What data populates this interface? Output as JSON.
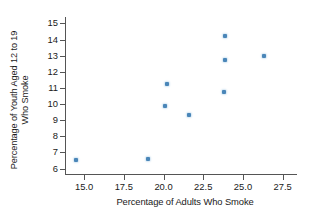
{
  "chart_data": {
    "type": "scatter",
    "title": "",
    "xlabel": "Percentage of Adults Who Smoke",
    "ylabel": "Percentage of Youth Aged 12 to 19 Who Smoke",
    "ylabel_line1": "Percentage of Youth Aged 12 to 19",
    "ylabel_line2": "Who Smoke",
    "xlim": [
      13.8,
      28.4
    ],
    "ylim": [
      5.6,
      15.4
    ],
    "xticks": [
      15.0,
      17.5,
      20.0,
      22.5,
      25.0,
      27.5
    ],
    "xtick_labels": [
      "15.0",
      "17.5",
      "20.0",
      "22.5",
      "25.0",
      "27.5"
    ],
    "yticks": [
      6,
      7,
      8,
      9,
      10,
      11,
      12,
      13,
      14,
      15
    ],
    "ytick_labels": [
      "6",
      "7",
      "8",
      "9",
      "10",
      "11",
      "12",
      "13",
      "14",
      "15"
    ],
    "grid": false,
    "legend": false,
    "marker_color": "#4a86b8",
    "axis_color": "#555555",
    "background": "#ffffff",
    "points": [
      {
        "x": 14.5,
        "y": 6.5
      },
      {
        "x": 19.0,
        "y": 6.6
      },
      {
        "x": 20.1,
        "y": 9.85
      },
      {
        "x": 20.2,
        "y": 11.25
      },
      {
        "x": 21.6,
        "y": 9.3
      },
      {
        "x": 23.8,
        "y": 10.75
      },
      {
        "x": 23.85,
        "y": 12.75
      },
      {
        "x": 23.9,
        "y": 14.2
      },
      {
        "x": 26.3,
        "y": 13.0
      }
    ]
  }
}
